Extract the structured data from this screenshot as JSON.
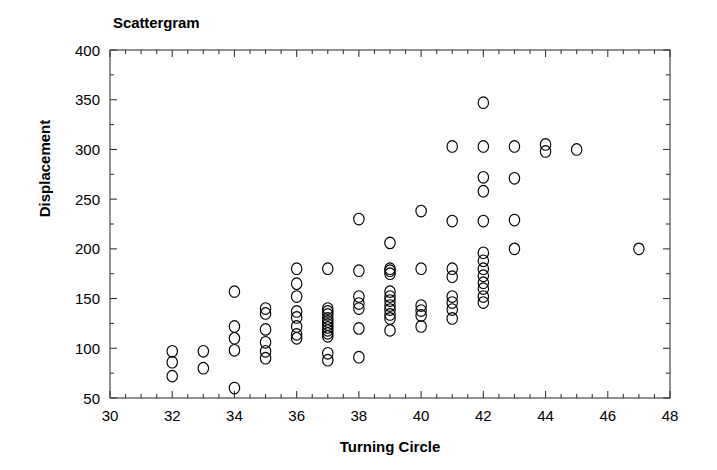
{
  "chart_data": {
    "type": "scatter",
    "title": "Scattergram",
    "xlabel": "Turning Circle",
    "ylabel": "Displacement",
    "xlim": [
      30,
      48
    ],
    "ylim": [
      50,
      400
    ],
    "x_major_ticks": [
      30,
      32,
      34,
      36,
      38,
      40,
      42,
      44,
      46,
      48
    ],
    "x_tick_labels": [
      "30",
      "32",
      "34",
      "36",
      "38",
      "40",
      "42",
      "44",
      "46",
      "48"
    ],
    "x_minor_step": 0.5,
    "y_major_ticks": [
      50,
      100,
      150,
      200,
      250,
      300,
      350,
      400
    ],
    "y_tick_labels": [
      "50",
      "100",
      "150",
      "200",
      "250",
      "300",
      "350",
      "400"
    ],
    "y_minor_step": 25,
    "grid": false,
    "legend": "none",
    "marker": "open-circle",
    "marker_color": "#000000",
    "marker_fill": "none",
    "points": [
      [
        32,
        97
      ],
      [
        32,
        86
      ],
      [
        32,
        72
      ],
      [
        33,
        97
      ],
      [
        33,
        80
      ],
      [
        34,
        157
      ],
      [
        34,
        122
      ],
      [
        34,
        110
      ],
      [
        34,
        98
      ],
      [
        34,
        60
      ],
      [
        35,
        140
      ],
      [
        35,
        135
      ],
      [
        35,
        119
      ],
      [
        35,
        106
      ],
      [
        35,
        97
      ],
      [
        35,
        90
      ],
      [
        36,
        180
      ],
      [
        36,
        165
      ],
      [
        36,
        152
      ],
      [
        36,
        137
      ],
      [
        36,
        131
      ],
      [
        36,
        122
      ],
      [
        36,
        114
      ],
      [
        36,
        110
      ],
      [
        37,
        180
      ],
      [
        37,
        140
      ],
      [
        37,
        137
      ],
      [
        37,
        134
      ],
      [
        37,
        130
      ],
      [
        37,
        127
      ],
      [
        37,
        124
      ],
      [
        37,
        121
      ],
      [
        37,
        118
      ],
      [
        37,
        115
      ],
      [
        37,
        112
      ],
      [
        37,
        95
      ],
      [
        37,
        88
      ],
      [
        38,
        230
      ],
      [
        38,
        178
      ],
      [
        38,
        152
      ],
      [
        38,
        145
      ],
      [
        38,
        140
      ],
      [
        38,
        120
      ],
      [
        38,
        91
      ],
      [
        39,
        206
      ],
      [
        39,
        180
      ],
      [
        39,
        178
      ],
      [
        39,
        175
      ],
      [
        39,
        157
      ],
      [
        39,
        152
      ],
      [
        39,
        148
      ],
      [
        39,
        143
      ],
      [
        39,
        139
      ],
      [
        39,
        134
      ],
      [
        39,
        130
      ],
      [
        39,
        118
      ],
      [
        40,
        238
      ],
      [
        40,
        180
      ],
      [
        40,
        143
      ],
      [
        40,
        138
      ],
      [
        40,
        133
      ],
      [
        40,
        122
      ],
      [
        41,
        303
      ],
      [
        41,
        228
      ],
      [
        41,
        180
      ],
      [
        41,
        172
      ],
      [
        41,
        152
      ],
      [
        41,
        146
      ],
      [
        41,
        139
      ],
      [
        41,
        130
      ],
      [
        42,
        347
      ],
      [
        42,
        303
      ],
      [
        42,
        272
      ],
      [
        42,
        258
      ],
      [
        42,
        228
      ],
      [
        42,
        196
      ],
      [
        42,
        188
      ],
      [
        42,
        180
      ],
      [
        42,
        173
      ],
      [
        42,
        166
      ],
      [
        42,
        160
      ],
      [
        42,
        152
      ],
      [
        42,
        146
      ],
      [
        43,
        303
      ],
      [
        43,
        271
      ],
      [
        43,
        229
      ],
      [
        43,
        200
      ],
      [
        44,
        305
      ],
      [
        44,
        298
      ],
      [
        45,
        300
      ],
      [
        47,
        200
      ]
    ]
  }
}
